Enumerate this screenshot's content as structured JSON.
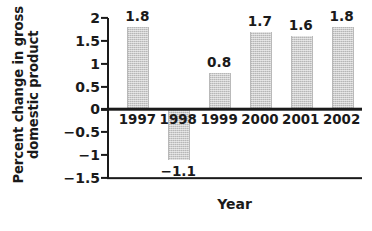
{
  "chart_data": {
    "type": "bar",
    "title": "",
    "subtitle": "",
    "xlabel": "Year",
    "ylabel": "Percent change in gross domestic product",
    "ylabel_line1": "Percent change in gross",
    "ylabel_line2": "domestic product",
    "categories": [
      "1997",
      "1998",
      "1999",
      "2000",
      "2001",
      "2002"
    ],
    "values": [
      1.8,
      -1.1,
      0.8,
      1.7,
      1.6,
      1.8
    ],
    "data_labels": [
      "1.8",
      "−1.1",
      "0.8",
      "1.7",
      "1.6",
      "1.8"
    ],
    "ylim": [
      -1.5,
      2
    ],
    "yticks": [
      2,
      1.5,
      1,
      0.5,
      0,
      -0.5,
      -1,
      -1.5
    ],
    "ytick_labels": [
      "2",
      "1.5",
      "1",
      "0.5",
      "0",
      "−0.5",
      "−1",
      "−1.5"
    ],
    "grid": false,
    "legend": null,
    "bar_color": "#cccccc",
    "axis_color": "#1a1a1a",
    "text_color": "#1a1a1a",
    "background": "#ffffff"
  }
}
